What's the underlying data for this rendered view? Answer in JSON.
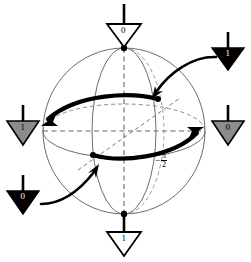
{
  "figure": {
    "background": "#ffffff",
    "stroke": "#000000",
    "sphere_outline_color": "#6b6b6b",
    "dashed_color": "#7a7a7a",
    "gray_fill": "#8c8c8c",
    "black_fill": "#000000",
    "white_fill": "#ffffff"
  },
  "annotation": {
    "minus": "−",
    "numerator": "π",
    "denominator": "2",
    "full_text": "−π/2"
  },
  "markers": [
    {
      "id": "top",
      "label": "0",
      "fill": "white",
      "text_color": "#000000",
      "position": "top"
    },
    {
      "id": "top-right",
      "label": "1",
      "fill": "black",
      "text_color": "#ffffff",
      "position": "top-right"
    },
    {
      "id": "left",
      "label": "1",
      "fill": "gray",
      "text_color": "#000000",
      "position": "left"
    },
    {
      "id": "right",
      "label": "0",
      "fill": "gray",
      "text_color": "#000000",
      "position": "right"
    },
    {
      "id": "bottom-left",
      "label": "0",
      "fill": "black",
      "text_color": "#ffffff",
      "position": "bottom-left"
    },
    {
      "id": "bottom",
      "label": "1",
      "fill": "white",
      "text_color": "#000000",
      "position": "bottom"
    }
  ],
  "sphere": {
    "center_x": 124,
    "center_y": 131,
    "radius_x": 81,
    "radius_y": 83,
    "pole_top": {
      "x": 124,
      "y": 48
    },
    "pole_bottom": {
      "x": 124,
      "y": 214
    }
  },
  "trajectories": [
    {
      "id": "upper-arc",
      "direction": "leftward",
      "endpoint_dot": true
    },
    {
      "id": "lower-arc",
      "direction": "rightward",
      "endpoint_dot": true
    }
  ],
  "pointers": [
    {
      "id": "pointer-from-top-right",
      "from": "top-right",
      "to": "upper-arc"
    },
    {
      "id": "pointer-from-bottom-left",
      "from": "bottom-left",
      "to": "lower-arc"
    }
  ]
}
